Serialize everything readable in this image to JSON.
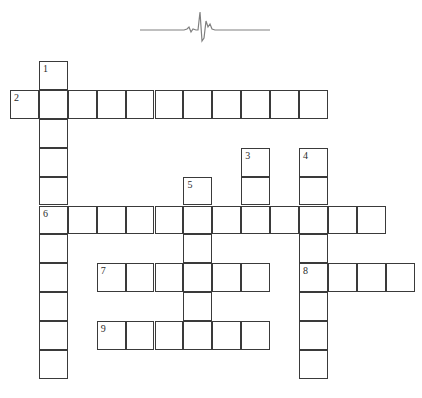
{
  "puzzle": {
    "title": "",
    "type": "crossword-grid",
    "geometry": {
      "origin_x": 10,
      "origin_y": 61,
      "cell_size": 28.9,
      "border_color": "#3a3a3a",
      "cell_fill": "#ffffff",
      "background": "#ffffff"
    },
    "decoration": {
      "name": "ecg-heartbeat-line",
      "stroke_color": "#808080",
      "path": "M0,22 L44,22 L48,20 L51,24 L54,22 L57,22 L60,4 L63,34 L66,14 L69,20 L72,16 L75,22 L130,22"
    },
    "entries": [
      {
        "number": "1",
        "direction": "down",
        "col": 2,
        "row": 1,
        "length": 11
      },
      {
        "number": "2",
        "direction": "across",
        "col": 1,
        "row": 2,
        "length": 11
      },
      {
        "number": "3",
        "direction": "down",
        "col": 9,
        "row": 4,
        "length": 3
      },
      {
        "number": "4",
        "direction": "down",
        "col": 11,
        "row": 4,
        "length": 8
      },
      {
        "number": "5",
        "direction": "down",
        "col": 7,
        "row": 5,
        "length": 6
      },
      {
        "number": "6",
        "direction": "across",
        "col": 2,
        "row": 6,
        "length": 12
      },
      {
        "number": "7",
        "direction": "across",
        "col": 4,
        "row": 8,
        "length": 6
      },
      {
        "number": "8",
        "direction": "across",
        "col": 11,
        "row": 8,
        "length": 4
      },
      {
        "number": "9",
        "direction": "across",
        "col": 4,
        "row": 10,
        "length": 6
      }
    ],
    "cells": [
      {
        "col": 2,
        "row": 1,
        "number": "1"
      },
      {
        "col": 1,
        "row": 2,
        "number": "2"
      },
      {
        "col": 2,
        "row": 2,
        "number": ""
      },
      {
        "col": 3,
        "row": 2,
        "number": ""
      },
      {
        "col": 4,
        "row": 2,
        "number": ""
      },
      {
        "col": 5,
        "row": 2,
        "number": ""
      },
      {
        "col": 6,
        "row": 2,
        "number": ""
      },
      {
        "col": 7,
        "row": 2,
        "number": ""
      },
      {
        "col": 8,
        "row": 2,
        "number": ""
      },
      {
        "col": 9,
        "row": 2,
        "number": ""
      },
      {
        "col": 10,
        "row": 2,
        "number": ""
      },
      {
        "col": 11,
        "row": 2,
        "number": ""
      },
      {
        "col": 2,
        "row": 3,
        "number": ""
      },
      {
        "col": 2,
        "row": 4,
        "number": ""
      },
      {
        "col": 9,
        "row": 4,
        "number": "3"
      },
      {
        "col": 11,
        "row": 4,
        "number": "4"
      },
      {
        "col": 2,
        "row": 5,
        "number": ""
      },
      {
        "col": 7,
        "row": 5,
        "number": "5"
      },
      {
        "col": 9,
        "row": 5,
        "number": ""
      },
      {
        "col": 11,
        "row": 5,
        "number": ""
      },
      {
        "col": 2,
        "row": 6,
        "number": "6"
      },
      {
        "col": 3,
        "row": 6,
        "number": ""
      },
      {
        "col": 4,
        "row": 6,
        "number": ""
      },
      {
        "col": 5,
        "row": 6,
        "number": ""
      },
      {
        "col": 6,
        "row": 6,
        "number": ""
      },
      {
        "col": 7,
        "row": 6,
        "number": ""
      },
      {
        "col": 8,
        "row": 6,
        "number": ""
      },
      {
        "col": 9,
        "row": 6,
        "number": ""
      },
      {
        "col": 10,
        "row": 6,
        "number": ""
      },
      {
        "col": 11,
        "row": 6,
        "number": ""
      },
      {
        "col": 12,
        "row": 6,
        "number": ""
      },
      {
        "col": 13,
        "row": 6,
        "number": ""
      },
      {
        "col": 2,
        "row": 7,
        "number": ""
      },
      {
        "col": 7,
        "row": 7,
        "number": ""
      },
      {
        "col": 11,
        "row": 7,
        "number": ""
      },
      {
        "col": 2,
        "row": 8,
        "number": ""
      },
      {
        "col": 4,
        "row": 8,
        "number": "7"
      },
      {
        "col": 5,
        "row": 8,
        "number": ""
      },
      {
        "col": 6,
        "row": 8,
        "number": ""
      },
      {
        "col": 7,
        "row": 8,
        "number": ""
      },
      {
        "col": 8,
        "row": 8,
        "number": ""
      },
      {
        "col": 9,
        "row": 8,
        "number": ""
      },
      {
        "col": 11,
        "row": 8,
        "number": "8"
      },
      {
        "col": 12,
        "row": 8,
        "number": ""
      },
      {
        "col": 13,
        "row": 8,
        "number": ""
      },
      {
        "col": 14,
        "row": 8,
        "number": ""
      },
      {
        "col": 2,
        "row": 9,
        "number": ""
      },
      {
        "col": 7,
        "row": 9,
        "number": ""
      },
      {
        "col": 11,
        "row": 9,
        "number": ""
      },
      {
        "col": 2,
        "row": 10,
        "number": ""
      },
      {
        "col": 4,
        "row": 10,
        "number": "9"
      },
      {
        "col": 5,
        "row": 10,
        "number": ""
      },
      {
        "col": 6,
        "row": 10,
        "number": ""
      },
      {
        "col": 7,
        "row": 10,
        "number": ""
      },
      {
        "col": 8,
        "row": 10,
        "number": ""
      },
      {
        "col": 9,
        "row": 10,
        "number": ""
      },
      {
        "col": 11,
        "row": 10,
        "number": ""
      },
      {
        "col": 2,
        "row": 11,
        "number": ""
      },
      {
        "col": 11,
        "row": 11,
        "number": ""
      }
    ]
  }
}
